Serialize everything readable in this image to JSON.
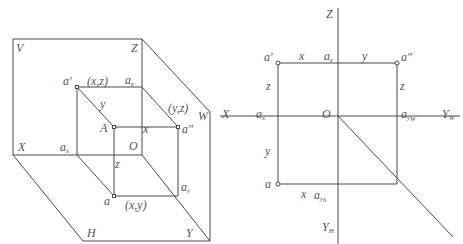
{
  "figure": {
    "left_diagram": {
      "description": "3D axonometric view of point A projected onto V, H, W planes",
      "plane_labels": {
        "V": "V",
        "H": "H",
        "W": "W"
      },
      "axis_labels": {
        "X": "X",
        "Y": "Y",
        "Z": "Z",
        "O": "O"
      },
      "points": {
        "A": "A",
        "a_prime": "a′",
        "a_double_prime": "a″",
        "a": "a",
        "a_x": "a",
        "a_x_sub": "x",
        "a_z": "a",
        "a_z_sub": "z",
        "a_y": "a",
        "a_y_sub": "y"
      },
      "coordinate_labels": {
        "xz": "(x,z)",
        "yz": "(y,z)",
        "xy": "(x,y)",
        "x": "x",
        "y": "y",
        "z": "z"
      }
    },
    "right_diagram": {
      "description": "Orthographic three-view projection unfolded",
      "axis_labels": {
        "Z": "Z",
        "X": "X",
        "O": "O",
        "Y_W": "Y",
        "Y_W_sub": "W",
        "Y_H": "Y",
        "Y_H_sub": "H"
      },
      "points": {
        "a_prime": "a′",
        "a_double_prime": "a″",
        "a": "a",
        "a_x": "a",
        "a_x_sub": "x",
        "a_z": "a",
        "a_z_sub": "z",
        "a_yw": "a",
        "a_yw_sub": "y",
        "a_yw_subsub": "W",
        "a_yh": "a",
        "a_yh_sub": "y",
        "a_yh_subsub": "h"
      },
      "distance_labels": {
        "x_top": "x",
        "y_top": "y",
        "z_left": "z",
        "z_right": "z",
        "y_left": "y",
        "x_bottom": "x"
      }
    }
  }
}
